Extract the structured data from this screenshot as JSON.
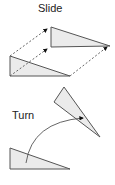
{
  "diagram": {
    "labels": {
      "slide": "Slide",
      "turn": "Turn"
    },
    "colors": {
      "stroke": "#555555",
      "fill": "#ebebeb",
      "text": "#222222"
    },
    "slide": {
      "original_triangle": [
        [
          10,
          56
        ],
        [
          10,
          76
        ],
        [
          70,
          76
        ]
      ],
      "moved_triangle": [
        [
          51,
          27
        ],
        [
          51,
          47
        ],
        [
          110,
          46
        ]
      ],
      "arrows": [
        {
          "from": [
            10,
            56
          ],
          "to": [
            47,
            29
          ]
        },
        {
          "from": [
            10,
            76
          ],
          "to": [
            47,
            49
          ]
        },
        {
          "from": [
            70,
            76
          ],
          "to": [
            107,
            47
          ]
        }
      ]
    },
    "turn": {
      "original_triangle": [
        [
          10,
          148
        ],
        [
          10,
          169
        ],
        [
          70,
          169
        ]
      ],
      "rotated_triangle": [
        [
          64,
          87
        ],
        [
          54,
          102
        ],
        [
          100,
          137
        ]
      ],
      "arc": {
        "from": [
          26,
          163
        ],
        "to": [
          83,
          118
        ]
      }
    }
  }
}
